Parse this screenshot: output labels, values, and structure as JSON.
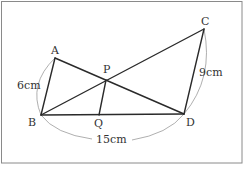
{
  "figure": {
    "points": {
      "A": {
        "label": "A",
        "x": 55,
        "y": 58
      },
      "B": {
        "label": "B",
        "x": 41,
        "y": 115
      },
      "C": {
        "label": "C",
        "x": 204,
        "y": 29
      },
      "D": {
        "label": "D",
        "x": 184,
        "y": 114
      },
      "P": {
        "label": "P",
        "x": 106,
        "y": 80
      },
      "Q": {
        "label": "Q",
        "x": 99,
        "y": 115
      }
    },
    "segments": [
      "AB",
      "AD",
      "BC",
      "BD",
      "CD",
      "PQ"
    ],
    "measurements": {
      "AB": "6cm",
      "BD": "15cm",
      "CD": "9cm"
    }
  }
}
